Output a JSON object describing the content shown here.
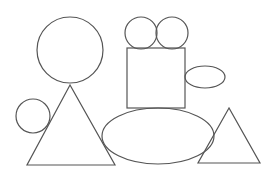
{
  "canvas": {
    "width": 274,
    "height": 181,
    "background": "#ffffff"
  },
  "style": {
    "stroke": "#555555",
    "stroke_width": 1.2,
    "fill": "none"
  },
  "shapes": [
    {
      "id": "large-circle",
      "type": "circle",
      "cx": 70,
      "cy": 50,
      "r": 33
    },
    {
      "id": "small-circle-top-left",
      "type": "circle",
      "cx": 141,
      "cy": 33,
      "r": 16
    },
    {
      "id": "small-circle-top-right",
      "type": "circle",
      "cx": 172,
      "cy": 33,
      "r": 16
    },
    {
      "id": "square",
      "type": "rect",
      "x": 127,
      "y": 48,
      "width": 58,
      "height": 60
    },
    {
      "id": "small-ellipse",
      "type": "ellipse",
      "cx": 205,
      "cy": 77,
      "rx": 20,
      "ry": 11
    },
    {
      "id": "small-circle-left",
      "type": "circle",
      "cx": 33,
      "cy": 116,
      "r": 17
    },
    {
      "id": "large-triangle",
      "type": "polygon",
      "points": "70,85 27,165 115,165"
    },
    {
      "id": "large-ellipse",
      "type": "ellipse",
      "cx": 158,
      "cy": 136,
      "rx": 56,
      "ry": 28
    },
    {
      "id": "small-triangle",
      "type": "polygon",
      "points": "229,108 198,163 260,163"
    }
  ]
}
